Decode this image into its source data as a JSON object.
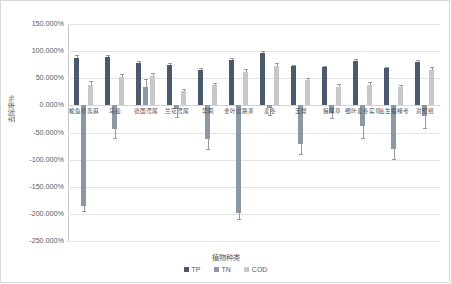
{
  "chart_data": {
    "type": "bar",
    "title": "",
    "xlabel": "植物种类",
    "ylabel": "去除率%",
    "ylim": [
      -250,
      150
    ],
    "ytick_values": [
      150,
      100,
      50,
      0,
      -50,
      -100,
      -150,
      -200,
      -250
    ],
    "ytick_labels": [
      "150.000%",
      "100.000%",
      "50.000%",
      "0.000%",
      "-50.000%",
      "-100.000%",
      "-150.000%",
      "-200.000%",
      "-250.000%"
    ],
    "grid": true,
    "legend_position": "bottom",
    "categories": [
      "梭鱼草蓖麻",
      "马蔺",
      "德国鸢尾",
      "兰花鸢尾",
      "早莉",
      "金叶过路黄",
      "麦冬",
      "玉簪",
      "狼尾草",
      "细叶麦冬实草",
      "丛生福禄考",
      "对照组"
    ],
    "series": [
      {
        "name": "TP",
        "color": "#4a5a6a",
        "values": [
          88,
          90,
          78,
          75,
          66,
          84,
          96,
          72,
          70,
          82,
          68,
          80
        ],
        "errors": [
          4,
          3,
          3,
          3,
          3,
          3,
          4,
          3,
          3,
          4,
          3,
          3
        ]
      },
      {
        "name": "TN",
        "color": "#8d98a5",
        "values": [
          -185,
          -44,
          34,
          -7,
          -62,
          -198,
          -5,
          -72,
          -14,
          -38,
          -80,
          -20
        ],
        "errors": [
          10,
          16,
          15,
          14,
          18,
          12,
          12,
          18,
          10,
          22,
          18,
          22
        ]
      },
      {
        "name": "COD",
        "color": "#c6c8ca",
        "values": [
          38,
          52,
          55,
          26,
          37,
          62,
          72,
          46,
          34,
          38,
          33,
          66
        ],
        "errors": [
          7,
          5,
          5,
          5,
          5,
          5,
          6,
          5,
          5,
          5,
          5,
          5
        ]
      }
    ]
  },
  "legend": {
    "items": [
      {
        "label": "TP",
        "color": "#4a5a6a"
      },
      {
        "label": "TN",
        "color": "#8d98a5"
      },
      {
        "label": "COD",
        "color": "#c6c8ca"
      }
    ]
  }
}
